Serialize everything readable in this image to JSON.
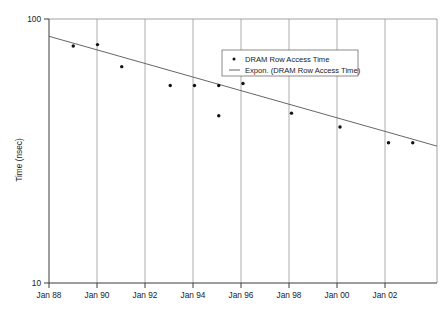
{
  "chart_data": {
    "type": "scatter",
    "title": "",
    "xlabel": "",
    "ylabel": "Time (nsec)",
    "yscale": "log",
    "ylim": [
      10,
      100
    ],
    "ytick_labels": [
      "100",
      "10"
    ],
    "xtick_labels": [
      "Jan 88",
      "Jan 90",
      "Jan 92",
      "Jan 94",
      "Jan 96",
      "Jan 98",
      "Jan 00",
      "Jan 02"
    ],
    "xlim": [
      "Jan 88",
      "Jan 04"
    ],
    "grid": true,
    "legend_position": "upper-right-inside",
    "legend": [
      {
        "label": "DRAM Row Access Time",
        "marker": "dot",
        "color": "#111111"
      },
      {
        "label": "Expon. (DRAM Row Access Time)",
        "marker": "line",
        "color": "#555555"
      }
    ],
    "series": [
      {
        "name": "DRAM Row Access Time",
        "x": [
          "Jan 89",
          "Jan 90",
          "Jan 91",
          "Jan 93",
          "Jan 94",
          "Jan 95",
          "Jan 95",
          "Jan 96",
          "Jan 98",
          "Jan 00",
          "Jan 02",
          "Jan 03"
        ],
        "values": [
          79,
          80,
          66,
          56,
          56,
          56,
          43,
          57,
          44,
          39,
          34,
          34
        ]
      },
      {
        "name": "Expon. (DRAM Row Access Time)",
        "type": "trendline",
        "x": [
          "Jan 88",
          "Jan 04"
        ],
        "values": [
          86,
          33
        ]
      }
    ]
  },
  "axis": {
    "y_top_label": "100",
    "y_bottom_label": "10",
    "y_title": "Time (nsec)"
  }
}
